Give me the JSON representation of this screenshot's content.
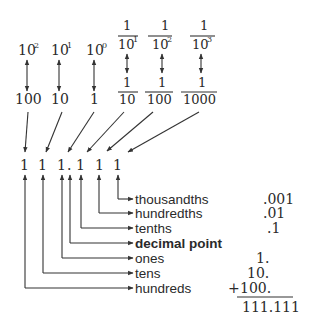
{
  "diagram": {
    "powers": [
      {
        "id": "hundreds",
        "base": "10",
        "exponent": "2",
        "value": "100"
      },
      {
        "id": "tens",
        "base": "10",
        "exponent": "1",
        "value": "10"
      },
      {
        "id": "ones",
        "base": "10",
        "exponent": "0",
        "value": "1"
      }
    ],
    "fractions": [
      {
        "id": "tenths",
        "numerator": "1",
        "denominator_base": "10",
        "denominator_exponent": "1",
        "value_numerator": "1",
        "value_denominator": "10"
      },
      {
        "id": "hundredths",
        "numerator": "1",
        "denominator_base": "10",
        "denominator_exponent": "2",
        "value_numerator": "1",
        "value_denominator": "100"
      },
      {
        "id": "thousandths",
        "numerator": "1",
        "denominator_base": "10",
        "denominator_exponent": "3",
        "value_numerator": "1",
        "value_denominator": "1000"
      }
    ],
    "digits": [
      "1",
      "1",
      "1",
      ".",
      "1",
      "1",
      "1"
    ],
    "labels": [
      {
        "text": "thousandths",
        "bold": false,
        "value": ".001"
      },
      {
        "text": "hundredths",
        "bold": false,
        "value": ".01"
      },
      {
        "text": "tenths",
        "bold": false,
        "value": ".1"
      },
      {
        "text": "decimal point",
        "bold": true,
        "value": ""
      },
      {
        "text": "ones",
        "bold": false,
        "value": "1."
      },
      {
        "text": "tens",
        "bold": false,
        "value": "10."
      },
      {
        "text": "hundreds",
        "bold": false,
        "value": "100."
      }
    ],
    "plus_sign": "+",
    "sum": "111.111"
  },
  "colors": {
    "ink": "#2a2a2a",
    "background": "#ffffff"
  }
}
